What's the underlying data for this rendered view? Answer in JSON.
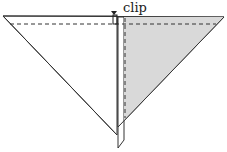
{
  "diagram": {
    "labels": {
      "clip": "clip"
    },
    "colors": {
      "line": "#333333",
      "shade": "#d9d9d9",
      "background": "#ffffff"
    },
    "elements": [
      "left-triangle-panel",
      "right-shaded-triangle-panel",
      "vertical-strip",
      "horizontal-fold-line-dashed",
      "vertical-fold-line-dashed",
      "clip-marker"
    ]
  }
}
